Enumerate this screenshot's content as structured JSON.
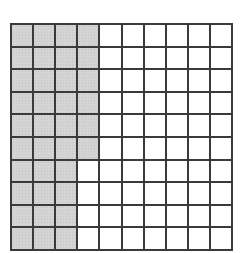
{
  "diagram": {
    "type": "hundred-grid",
    "rows": 10,
    "columns": 10,
    "shaded_per_row": [
      4,
      4,
      4,
      4,
      4,
      4,
      3,
      3,
      3,
      3
    ],
    "total_shaded": 36,
    "total_cells": 100,
    "colors": {
      "shaded": "#d4d4d4",
      "unshaded": "#ffffff",
      "grid_line": "#3a3a3a"
    }
  }
}
